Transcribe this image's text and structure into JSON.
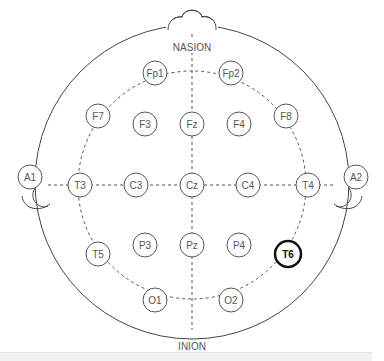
{
  "landmarks": {
    "nasion": "NASION",
    "inion": "INION"
  },
  "highlight_color": "#111111",
  "line_color": "#555555",
  "electrodes": [
    {
      "id": "Fp1",
      "label": "Fp1",
      "x": 155,
      "y": 73,
      "highlighted": false
    },
    {
      "id": "Fp2",
      "label": "Fp2",
      "x": 231,
      "y": 73,
      "highlighted": false
    },
    {
      "id": "F7",
      "label": "F7",
      "x": 98,
      "y": 116,
      "highlighted": false
    },
    {
      "id": "F3",
      "label": "F3",
      "x": 145,
      "y": 124,
      "highlighted": false
    },
    {
      "id": "Fz",
      "label": "Fz",
      "x": 192,
      "y": 124,
      "highlighted": false
    },
    {
      "id": "F4",
      "label": "F4",
      "x": 239,
      "y": 124,
      "highlighted": false
    },
    {
      "id": "F8",
      "label": "F8",
      "x": 286,
      "y": 116,
      "highlighted": false
    },
    {
      "id": "T3",
      "label": "T3",
      "x": 80,
      "y": 185,
      "highlighted": false
    },
    {
      "id": "C3",
      "label": "C3",
      "x": 136,
      "y": 185,
      "highlighted": false
    },
    {
      "id": "Cz",
      "label": "Cz",
      "x": 192,
      "y": 185,
      "highlighted": false
    },
    {
      "id": "C4",
      "label": "C4",
      "x": 248,
      "y": 185,
      "highlighted": false
    },
    {
      "id": "T4",
      "label": "T4",
      "x": 308,
      "y": 185,
      "highlighted": false
    },
    {
      "id": "T5",
      "label": "T5",
      "x": 98,
      "y": 254,
      "highlighted": false
    },
    {
      "id": "P3",
      "label": "P3",
      "x": 145,
      "y": 245,
      "highlighted": false
    },
    {
      "id": "Pz",
      "label": "Pz",
      "x": 192,
      "y": 245,
      "highlighted": false
    },
    {
      "id": "P4",
      "label": "P4",
      "x": 239,
      "y": 245,
      "highlighted": false
    },
    {
      "id": "T6",
      "label": "T6",
      "x": 288,
      "y": 254,
      "highlighted": true
    },
    {
      "id": "O1",
      "label": "O1",
      "x": 155,
      "y": 300,
      "highlighted": false
    },
    {
      "id": "O2",
      "label": "O2",
      "x": 231,
      "y": 300,
      "highlighted": false
    }
  ],
  "ears": [
    {
      "id": "A1",
      "label": "A1",
      "x": 30,
      "y": 177
    },
    {
      "id": "A2",
      "label": "A2",
      "x": 356,
      "y": 177
    }
  ]
}
